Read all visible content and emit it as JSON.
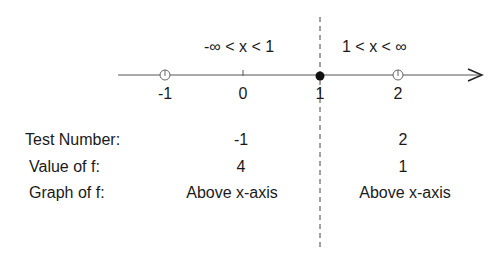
{
  "intervals": [
    {
      "label": "-∞ < x < 1"
    },
    {
      "label": "1 < x < ∞"
    }
  ],
  "number_line": {
    "ticks": [
      "-1",
      "0",
      "1",
      "2"
    ],
    "critical_point": "1",
    "test_points": [
      "-1",
      "2"
    ]
  },
  "table": {
    "row_labels": [
      "Test Number:",
      "Value of f:",
      "Graph of f:"
    ],
    "columns": [
      {
        "test_number": "-1",
        "value": "4",
        "graph": "Above x-axis"
      },
      {
        "test_number": "2",
        "value": "1",
        "graph": "Above x-axis"
      }
    ]
  },
  "colors": {
    "ink": "#1a1a1a",
    "axis": "#555555"
  }
}
